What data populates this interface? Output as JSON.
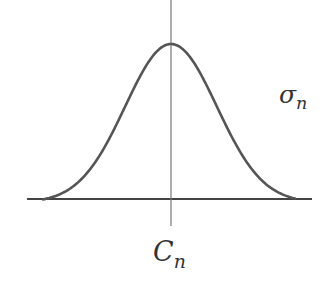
{
  "diagram": {
    "type": "gaussian-curve",
    "colors": {
      "curve": "#555555",
      "axis": "#444444",
      "center_line": "#777777",
      "text": "#333333",
      "background": "#ffffff"
    },
    "labels": {
      "sigma": {
        "main": "σ",
        "sub": "n"
      },
      "center": {
        "main": "C",
        "sub": "n"
      }
    },
    "geometry": {
      "baseline_y": 199,
      "axis_x_start": 27,
      "axis_x_end": 312,
      "center_x": 171,
      "center_line_top": 0,
      "center_line_bottom": 226,
      "peak_y": 44,
      "curve_left_x": 43,
      "curve_right_x": 295
    }
  }
}
